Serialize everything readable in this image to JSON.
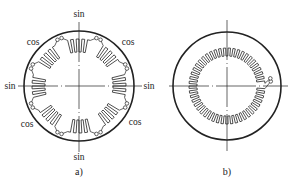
{
  "colors": {
    "stroke": "#222222",
    "background": "#ffffff"
  },
  "figures": [
    {
      "id": "a",
      "caption": "a)",
      "center": [
        79,
        86
      ],
      "outer_radius": 55,
      "axis": {
        "v_top": 22,
        "v_bottom": 152,
        "h_left": 18,
        "h_right": 142
      },
      "coils": {
        "count": 8,
        "teeth": 4,
        "r_in": 34,
        "r_out": 47,
        "span_deg": 28,
        "terminal_r": 51
      },
      "labels": [
        {
          "text": "sin",
          "x": 79,
          "y": 15
        },
        {
          "text": "sin",
          "x": 10,
          "y": 87
        },
        {
          "text": "sin",
          "x": 149,
          "y": 87
        },
        {
          "text": "sin",
          "x": 79,
          "y": 158
        },
        {
          "text": "cos",
          "x": 33,
          "y": 43
        },
        {
          "text": "cos",
          "x": 128,
          "y": 43
        },
        {
          "text": "cos",
          "x": 27,
          "y": 125
        },
        {
          "text": "cos",
          "x": 135,
          "y": 123
        }
      ],
      "caption_pos": [
        79,
        172
      ]
    },
    {
      "id": "b",
      "caption": "b)",
      "center": [
        227,
        86
      ],
      "outer_radius": 54,
      "axis": {
        "v_top": 20,
        "v_bottom": 151,
        "h_left": 169,
        "h_right": 288
      },
      "meander": {
        "teeth": 48,
        "r_in": 30,
        "r_out": 38,
        "gap_deg": 8,
        "terminal_r": 44
      },
      "labels": [],
      "caption_pos": [
        227,
        172
      ]
    }
  ]
}
